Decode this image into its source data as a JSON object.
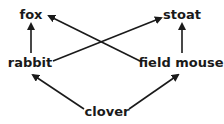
{
  "diagram": {
    "type": "food-web",
    "nodes": [
      {
        "id": "fox",
        "label": "fox"
      },
      {
        "id": "stoat",
        "label": "stoat"
      },
      {
        "id": "rabbit",
        "label": "rabbit"
      },
      {
        "id": "field_mouse",
        "label": "field mouse"
      },
      {
        "id": "clover",
        "label": "clover"
      }
    ],
    "edges": [
      {
        "from": "rabbit",
        "to": "fox"
      },
      {
        "from": "field_mouse",
        "to": "stoat"
      },
      {
        "from": "rabbit",
        "to": "stoat"
      },
      {
        "from": "field_mouse",
        "to": "fox"
      },
      {
        "from": "clover",
        "to": "rabbit"
      },
      {
        "from": "clover",
        "to": "field_mouse"
      }
    ],
    "colors": {
      "text": "#1a1a1a",
      "arrow": "#1a1a1a",
      "background": "#ffffff"
    }
  }
}
